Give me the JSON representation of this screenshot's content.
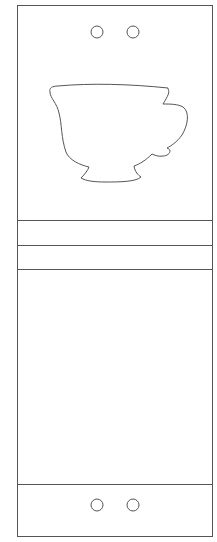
{
  "colors": {
    "background": "#ffffff",
    "outline": "#555555"
  },
  "outline": {
    "x": 17,
    "y": 5,
    "width": 195,
    "height": 531
  },
  "holes": {
    "top": [
      {
        "cx": 97,
        "cy": 32,
        "r": 6
      },
      {
        "cx": 133,
        "cy": 32,
        "r": 6
      }
    ],
    "bottom": [
      {
        "cx": 97,
        "cy": 505,
        "r": 6
      },
      {
        "cx": 133,
        "cy": 505,
        "r": 6
      }
    ]
  },
  "fold_lines_y": [
    220,
    245,
    269,
    484
  ],
  "shapes": {
    "cup_icon": "teacup-icon"
  }
}
